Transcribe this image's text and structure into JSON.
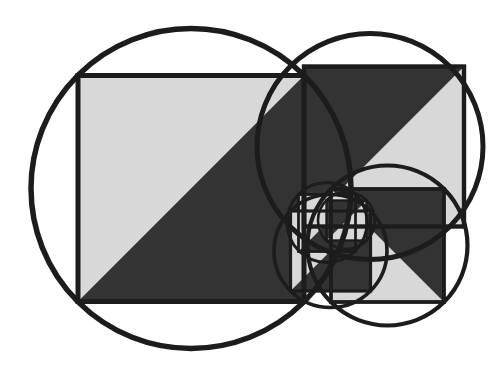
{
  "canvas": {
    "width": 492,
    "height": 378,
    "background_color": "#ffffff",
    "title": "Recursive Square Circle Triangle Spiral"
  },
  "palette": {
    "stroke_color": "#1c1c1c",
    "light_fill": "#d8d8d8",
    "dark_fill": "#333333",
    "background_color": "#ffffff"
  },
  "geometry": {
    "description": "Self-similar spiral of squares, each inscribed in a circle, each split by a diagonal into a light half and a dark triangular half. Each successive square is scaled by 1/sqrt(2) and rotated 90 degrees, anchored at the previous square's corner.",
    "scale_factor": 0.7071,
    "rotation_step_degrees": 90,
    "iterations": 6,
    "anchor_corner": "top-right"
  },
  "stroke_widths": {
    "circle_level_1": 5.5,
    "circle_level_2": 5.0,
    "circle_level_3": 4.2,
    "circle_level_4": 3.6,
    "circle_level_5": 3.0,
    "circle_level_6": 2.6,
    "square_level_1": 5.0,
    "square_level_2": 4.4,
    "square_level_3": 3.8,
    "square_level_4": 3.2,
    "square_level_5": 2.8,
    "square_level_6": 2.4
  },
  "chart_data": {
    "type": "scatter",
    "xlabel": "",
    "ylabel": "",
    "xlim": [
      0,
      492
    ],
    "ylim": [
      0,
      378
    ],
    "grid": false,
    "legend": "none",
    "series": [
      {
        "name": "circles",
        "values": [
          {
            "level": 1,
            "cx": 191.0,
            "cy": 188.5,
            "r": 160.0
          },
          {
            "level": 2,
            "cx": 370.0,
            "cy": 146.5,
            "r": 113.0
          },
          {
            "level": 3,
            "cx": 387.5,
            "cy": 245.5,
            "r": 80.0
          },
          {
            "level": 4,
            "cx": 330.5,
            "cy": 251.0,
            "r": 56.5
          },
          {
            "level": 5,
            "cx": 327.0,
            "cy": 222.5,
            "r": 40.0
          },
          {
            "level": 6,
            "cx": 346.5,
            "cy": 220.5,
            "r": 28.5
          }
        ]
      },
      {
        "name": "squares",
        "values": [
          {
            "level": 1,
            "x": 78.0,
            "y": 75.5,
            "side": 226.0,
            "rotation": 0
          },
          {
            "level": 2,
            "x": 304.0,
            "y": 66.5,
            "side": 160.0,
            "rotation": 0
          },
          {
            "level": 3,
            "x": 331.0,
            "y": 189.0,
            "side": 113.0,
            "rotation": 0
          },
          {
            "level": 4,
            "x": 290.5,
            "y": 211.0,
            "side": 80.0,
            "rotation": 0
          },
          {
            "level": 5,
            "x": 298.5,
            "y": 194.5,
            "side": 57.0,
            "rotation": 0
          },
          {
            "level": 6,
            "x": 326.5,
            "y": 200.5,
            "side": 40.0,
            "rotation": 0
          }
        ]
      }
    ],
    "annotations": [
      {
        "label": "large-circle-circumscribing-square",
        "x": 191,
        "y": 188
      },
      {
        "label": "large-square-with-dark-lower-left-triangle",
        "x": 191,
        "y": 188
      },
      {
        "label": "second-square-with-dark-upper-left-triangle",
        "x": 384,
        "y": 146
      },
      {
        "label": "spiral-convergence-point",
        "x": 345,
        "y": 232
      }
    ]
  }
}
